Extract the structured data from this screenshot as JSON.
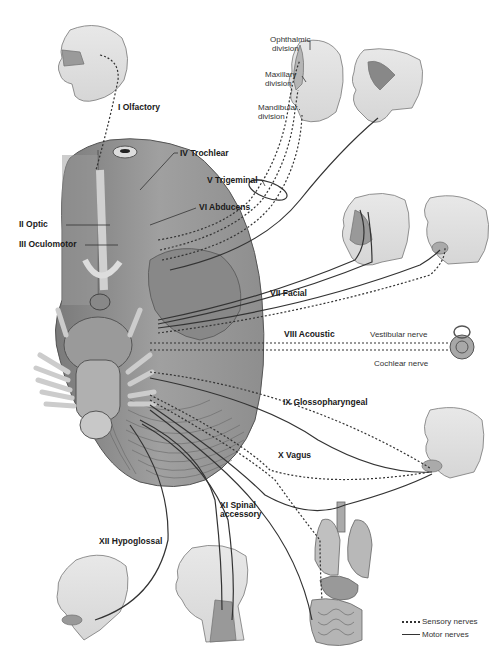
{
  "diagram": {
    "nerves": [
      {
        "id": "I",
        "label": "I Olfactory",
        "x": 118,
        "y": 103
      },
      {
        "id": "II",
        "label": "II Optic",
        "x": 19,
        "y": 223
      },
      {
        "id": "III",
        "label": "III Oculomotor",
        "x": 19,
        "y": 243
      },
      {
        "id": "IV",
        "label": "IV Trochlear",
        "x": 178,
        "y": 150
      },
      {
        "id": "V",
        "label": "V Trigeminal",
        "x": 207,
        "y": 178
      },
      {
        "id": "VI",
        "label": "VI Abducens",
        "x": 199,
        "y": 206
      },
      {
        "id": "VII",
        "label": "VII Facial",
        "x": 270,
        "y": 291
      },
      {
        "id": "VIII",
        "label": "VIII Acoustic",
        "x": 284,
        "y": 332
      },
      {
        "id": "IX",
        "label": "IX Glossopharyngeal",
        "x": 283,
        "y": 400
      },
      {
        "id": "X",
        "label": "X Vagus",
        "x": 278,
        "y": 453
      },
      {
        "id": "XI",
        "label_line1": "XI Spinal",
        "label_line2": "accessory",
        "x": 220,
        "y": 502
      },
      {
        "id": "XII",
        "label": "XII Hypoglossal",
        "x": 99,
        "y": 539
      }
    ],
    "trigeminal_divisions": [
      {
        "line1": "Ophthalmic",
        "line2": "division",
        "x": 270,
        "y": 38
      },
      {
        "line1": "Maxillary",
        "line2": "division",
        "x": 265,
        "y": 73
      },
      {
        "line1": "Mandibular",
        "line2": "division",
        "x": 258,
        "y": 106
      }
    ],
    "acoustic_branches": [
      {
        "label": "Vestibular nerve",
        "x": 370,
        "y": 333
      },
      {
        "label": "Cochlear nerve",
        "x": 374,
        "y": 362
      }
    ],
    "legend": {
      "sensory": "Sensory nerves",
      "motor": "Motor nerves"
    },
    "colors": {
      "line": "#333333",
      "brain_dark": "#8a8a8a",
      "brain_mid": "#a8a8a8",
      "skin": "#e4e4e4",
      "skin_outline": "#777777"
    }
  }
}
